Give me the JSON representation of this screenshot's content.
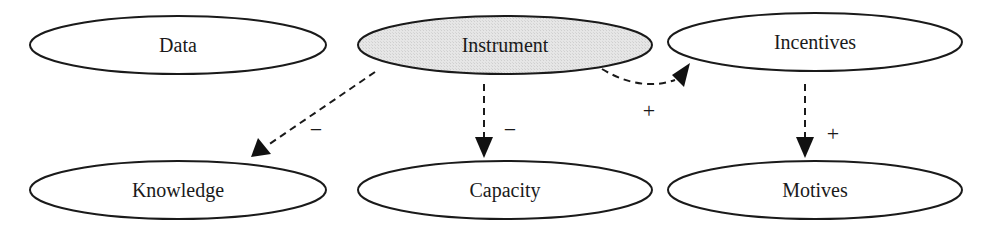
{
  "diagram": {
    "type": "causal-diagram",
    "colors": {
      "stroke": "#1a1a1a",
      "node_fill": "#ffffff",
      "highlight_fill": "#e3e3e3",
      "background": "#ffffff"
    },
    "nodes": [
      {
        "id": "data",
        "label": "Data",
        "highlighted": false
      },
      {
        "id": "instrument",
        "label": "Instrument",
        "highlighted": true
      },
      {
        "id": "incentives",
        "label": "Incentives",
        "highlighted": false
      },
      {
        "id": "knowledge",
        "label": "Knowledge",
        "highlighted": false
      },
      {
        "id": "capacity",
        "label": "Capacity",
        "highlighted": false
      },
      {
        "id": "motives",
        "label": "Motives",
        "highlighted": false
      }
    ],
    "edges": [
      {
        "from": "instrument",
        "to": "knowledge",
        "sign": "−",
        "style": "dashed"
      },
      {
        "from": "instrument",
        "to": "capacity",
        "sign": "−",
        "style": "dashed"
      },
      {
        "from": "instrument",
        "to": "incentives",
        "sign": "+",
        "style": "dashed"
      },
      {
        "from": "incentives",
        "to": "motives",
        "sign": "+",
        "style": "dashed"
      }
    ]
  }
}
